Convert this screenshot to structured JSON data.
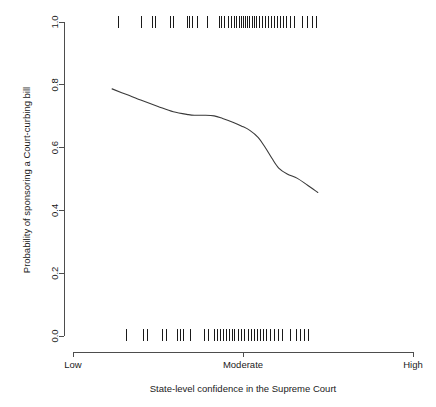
{
  "chart_data": {
    "type": "line",
    "title": "",
    "xlabel": "State-level confidence in the Supreme Court",
    "ylabel": "Probability of sponsoring a Court-curbing bill",
    "ylim": [
      0.0,
      1.0
    ],
    "xlim": [
      0,
      1
    ],
    "grid": false,
    "legend": null,
    "y_ticks": [
      {
        "value": 0.0,
        "label": "0.0"
      },
      {
        "value": 0.2,
        "label": "0.2"
      },
      {
        "value": 0.4,
        "label": "0.4"
      },
      {
        "value": 0.6,
        "label": "0.6"
      },
      {
        "value": 0.8,
        "label": "0.8"
      },
      {
        "value": 1.0,
        "label": "1.0"
      }
    ],
    "x_ticks": [
      {
        "value": 0.0,
        "label": "Low"
      },
      {
        "value": 0.5,
        "label": "Moderate"
      },
      {
        "value": 1.0,
        "label": "High"
      }
    ],
    "series": [
      {
        "name": "fitted probability",
        "x": [
          0.115,
          0.16,
          0.205,
          0.25,
          0.295,
          0.34,
          0.36,
          0.385,
          0.415,
          0.44,
          0.47,
          0.495,
          0.52,
          0.545,
          0.565,
          0.585,
          0.605,
          0.63,
          0.66,
          0.69,
          0.72
        ],
        "y": [
          0.787,
          0.768,
          0.749,
          0.731,
          0.714,
          0.705,
          0.703,
          0.703,
          0.701,
          0.693,
          0.681,
          0.669,
          0.655,
          0.632,
          0.601,
          0.566,
          0.535,
          0.516,
          0.502,
          0.48,
          0.457
        ]
      }
    ],
    "rug_top": {
      "y": 1.0,
      "values": [
        0.133,
        0.2,
        0.233,
        0.243,
        0.288,
        0.297,
        0.337,
        0.344,
        0.352,
        0.367,
        0.396,
        0.43,
        0.437,
        0.447,
        0.458,
        0.466,
        0.476,
        0.482,
        0.489,
        0.495,
        0.501,
        0.508,
        0.514,
        0.52,
        0.527,
        0.534,
        0.541,
        0.548,
        0.556,
        0.566,
        0.575,
        0.583,
        0.592,
        0.601,
        0.609,
        0.619,
        0.629,
        0.639,
        0.65,
        0.676,
        0.69,
        0.704,
        0.717
      ]
    },
    "rug_bottom": {
      "y": 0.0,
      "values": [
        0.158,
        0.206,
        0.219,
        0.263,
        0.274,
        0.307,
        0.316,
        0.325,
        0.346,
        0.388,
        0.398,
        0.415,
        0.426,
        0.434,
        0.443,
        0.452,
        0.46,
        0.468,
        0.476,
        0.486,
        0.495,
        0.505,
        0.515,
        0.524,
        0.533,
        0.543,
        0.552,
        0.56,
        0.57,
        0.58,
        0.592,
        0.604,
        0.617,
        0.64,
        0.657,
        0.668,
        0.68,
        0.692
      ]
    },
    "colors": {
      "curve": "#3a3a3a",
      "axis": "#4d4d4d",
      "rug": "#1a1a1a",
      "background": "#ffffff"
    }
  }
}
